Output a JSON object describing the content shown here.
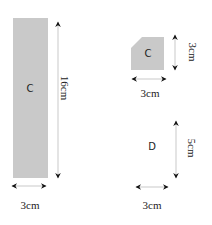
{
  "colors": {
    "shape_fill": "#c9c9c9",
    "arrow": "#111111",
    "guide_line": "#bbbbbb",
    "text": "#222222"
  },
  "shapes": [
    {
      "id": "tall-rectangle",
      "label": "C",
      "height_label": "16cm",
      "width_label": "3cm"
    },
    {
      "id": "small-cut-square",
      "label": "C",
      "height_label": "3cm",
      "width_label": "3cm"
    },
    {
      "id": "shape-d",
      "label": "D",
      "height_label": "5cm",
      "width_label": "3cm"
    }
  ]
}
